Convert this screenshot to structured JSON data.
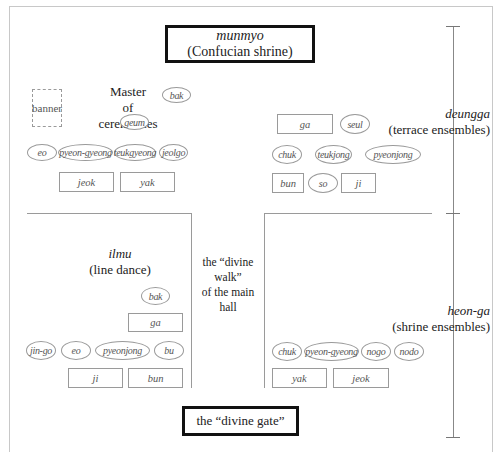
{
  "diagram": {
    "top_box": {
      "title": "munmyo",
      "subtitle": "(Confucian shrine)"
    },
    "bottom_box": {
      "label": "the “divine gate”"
    },
    "master": {
      "line1": "Master",
      "line2": "of ceremonies"
    },
    "banner": "banner",
    "divine_walk": {
      "line1": "the “divine walk”",
      "line2": "of the main hall"
    },
    "ilmu": {
      "title": "ilmu",
      "subtitle": "(line dance)"
    },
    "side_labels": {
      "deungga": {
        "title": "deungga",
        "subtitle": "(terrace ensembles)"
      },
      "heonga": {
        "title": "heon-ga",
        "subtitle": "(shrine ensembles)"
      }
    },
    "terrace_left": {
      "bak": "bak",
      "geum": "geum",
      "row_ovals": [
        "eo",
        "pyeon-gyeong",
        "teukgyeong",
        "jeolgo"
      ],
      "row_rects": [
        "jeok",
        "yak"
      ]
    },
    "terrace_right": {
      "ga": "ga",
      "seul": "seul",
      "row_ovals": [
        "chuk",
        "teukjong",
        "pyeonjong"
      ],
      "row_mixed": [
        "bun",
        "so",
        "ji"
      ]
    },
    "shrine_left": {
      "bak": "bak",
      "ga": "ga",
      "row_ovals": [
        "jin-go",
        "eo",
        "pyeonjong",
        "bu"
      ],
      "row_rects": [
        "ji",
        "bun"
      ]
    },
    "shrine_right": {
      "row_ovals": [
        "chuk",
        "pyeon-gyeong",
        "nogo",
        "nodo"
      ],
      "row_rects": [
        "yak",
        "jeok"
      ]
    }
  }
}
